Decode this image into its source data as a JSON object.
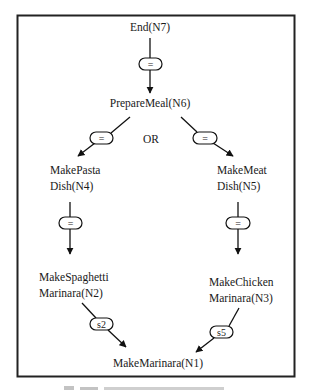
{
  "diagram": {
    "frame_color": "#222222",
    "nodes": {
      "n7": {
        "label": "End(N7)"
      },
      "n6": {
        "label": "PrepareMeal(N6)"
      },
      "n4": {
        "line1": "MakePasta",
        "line2": "Dish(N4)"
      },
      "n5": {
        "line1": "MakeMeat",
        "line2": "Dish(N5)"
      },
      "n2": {
        "line1": "MakeSpaghetti",
        "line2": "Marinara(N2)"
      },
      "n3": {
        "line1": "MakeChicken",
        "line2": "Marinara(N3)"
      },
      "n1": {
        "label": "MakeMarinara(N1)"
      }
    },
    "or_label": "OR",
    "edges": [
      {
        "from": "N7",
        "to": "N6",
        "label": "="
      },
      {
        "from": "N6",
        "to": "N4",
        "label": "="
      },
      {
        "from": "N6",
        "to": "N5",
        "label": "="
      },
      {
        "from": "N4",
        "to": "N2",
        "label": "="
      },
      {
        "from": "N5",
        "to": "N3",
        "label": "="
      },
      {
        "from": "N2",
        "to": "N1",
        "label": "s2"
      },
      {
        "from": "N3",
        "to": "N1",
        "label": "s5"
      }
    ],
    "edge_labels": {
      "e_n7_n6": "=",
      "e_n6_n4": "=",
      "e_n6_n5": "=",
      "e_n4_n2": "=",
      "e_n5_n3": "=",
      "e_n2_n1": "s2",
      "e_n3_n1": "s5"
    }
  }
}
